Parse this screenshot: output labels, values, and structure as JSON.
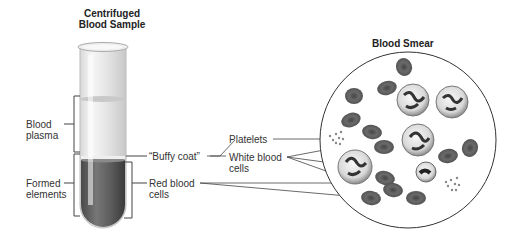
{
  "titles": {
    "tube_line1": "Centrifuged",
    "tube_line2": "Blood Sample",
    "smear": "Blood Smear"
  },
  "labels": {
    "plasma_line1": "Blood",
    "plasma_line2": "plasma",
    "formed_line1": "Formed",
    "formed_line2": "elements",
    "buffy_coat": "“Buffy coat”",
    "platelets": "Platelets",
    "wbc_line1": "White blood",
    "wbc_line2": "cells",
    "rbc_line1": "Red blood",
    "rbc_line2": "cells"
  },
  "colors": {
    "plasma": "#e6e6e6",
    "rbc_layer": "#5a5a5a",
    "cell_dark": "#6e6e6e",
    "line": "#444444"
  }
}
